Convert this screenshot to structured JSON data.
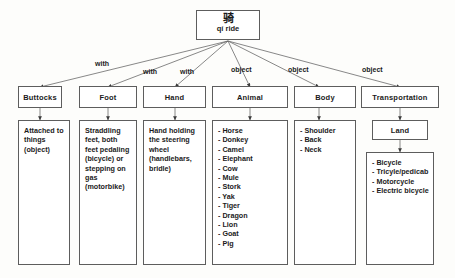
{
  "diagram": {
    "title_node": {
      "han": "骑",
      "roman": "qí ride"
    },
    "edge_labels": [
      "with",
      "with",
      "with",
      "object",
      "object",
      "object"
    ],
    "branches": [
      {
        "id": "buttocks",
        "category": "Buttocks",
        "edge": "with",
        "content_type": "paragraph",
        "text": "Attached to things (object)"
      },
      {
        "id": "foot",
        "category": "Foot",
        "edge": "with",
        "content_type": "paragraph",
        "text": "Straddling feet, both feet pedaling (bicycle) or stepping on gas (motorbike)"
      },
      {
        "id": "hand",
        "category": "Hand",
        "edge": "with",
        "content_type": "paragraph",
        "text": "Hand holding the steering wheel (handlebars, bridle)"
      },
      {
        "id": "animal",
        "category": "Animal",
        "edge": "object",
        "content_type": "list",
        "items": [
          "Horse",
          "Donkey",
          "Camel",
          "Elephant",
          "Cow",
          "Mule",
          "Stork",
          "Yak",
          "Tiger",
          "Dragon",
          "Lion",
          "Goat",
          "Pig"
        ]
      },
      {
        "id": "body",
        "category": "Body",
        "edge": "object",
        "content_type": "list",
        "items": [
          "Shoulder",
          "Back",
          "Neck"
        ]
      },
      {
        "id": "transportation",
        "category": "Transportation",
        "edge": "object",
        "intermediate": "Land",
        "content_type": "list",
        "items": [
          "Bicycle",
          "Tricyle/pedicab",
          "Motorcycle",
          "Electric bicycle"
        ]
      }
    ],
    "colors": {
      "border": "#5d5d5d",
      "text": "#1b1b1b",
      "background": "#fdfdfb",
      "box_fill": "#ffffff"
    }
  }
}
